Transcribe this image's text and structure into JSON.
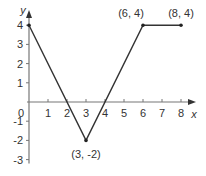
{
  "chart_data": {
    "type": "line",
    "title": "",
    "xlabel": "x",
    "ylabel": "y",
    "xlim": [
      0,
      8
    ],
    "ylim": [
      -3,
      4
    ],
    "grid": false,
    "x_ticks": [
      "1",
      "2",
      "3",
      "4",
      "5",
      "6",
      "7",
      "8"
    ],
    "y_ticks": [
      "4",
      "3",
      "2",
      "1",
      "-1",
      "-2",
      "-3"
    ],
    "origin_label": "0",
    "series": [
      {
        "name": "piecewise",
        "x": [
          0,
          3,
          6,
          8
        ],
        "y": [
          4,
          -2,
          4,
          4
        ]
      }
    ],
    "annotations": [
      {
        "text": "(3, -2)",
        "x": 3,
        "y": -2
      },
      {
        "text": "(6, 4)",
        "x": 6,
        "y": 4
      },
      {
        "text": "(8, 4)",
        "x": 8,
        "y": 4
      }
    ],
    "colors": {
      "axis": "#777777",
      "line": "#333333",
      "text": "#333333"
    }
  }
}
